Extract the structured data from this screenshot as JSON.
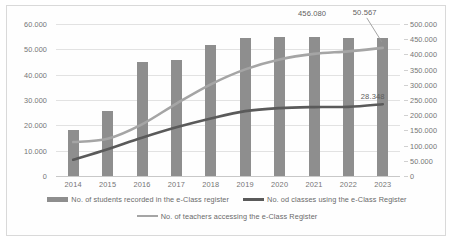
{
  "chart_data": {
    "type": "bar",
    "title": "",
    "subtitle": "",
    "xlabel": "",
    "ylabel": "",
    "grid": true,
    "legend_position": "bottom",
    "categories": [
      "2014",
      "2015",
      "2016",
      "2017",
      "2018",
      "2019",
      "2020",
      "2021",
      "2022",
      "2023"
    ],
    "axes": {
      "left": {
        "ticks": [
          "0",
          "10.000",
          "20.000",
          "30.000",
          "40.000",
          "50.000",
          "60.000"
        ],
        "values": [
          0,
          10000,
          20000,
          30000,
          40000,
          50000,
          60000
        ],
        "min": 0,
        "max": 60000
      },
      "right": {
        "ticks": [
          "0",
          "50.000",
          "100.000",
          "150.000",
          "200.000",
          "250.000",
          "300.000",
          "350.000",
          "400.000",
          "450.000",
          "500.000"
        ],
        "values": [
          0,
          50000,
          100000,
          150000,
          200000,
          250000,
          300000,
          350000,
          400000,
          450000,
          500000
        ],
        "min": 0,
        "max": 500000
      }
    },
    "series": [
      {
        "name": "No. of students recorded in the e-Class register",
        "type": "bar",
        "axis": "right",
        "color": "#8e8e8e",
        "values": [
          150000,
          213000,
          375000,
          383000,
          430000,
          455000,
          456000,
          456080,
          454000,
          455500
        ]
      },
      {
        "name": "No. od classes using the e-Class Register",
        "type": "line",
        "axis": "left",
        "color": "#5a5a5a",
        "values": [
          6400,
          10600,
          15100,
          19200,
          22700,
          25600,
          26800,
          27200,
          27300,
          28348
        ]
      },
      {
        "name": "No. of teachers accessing the e-Class Register",
        "type": "line",
        "axis": "left",
        "color": "#a5a5a5",
        "values": [
          13400,
          14700,
          20400,
          28600,
          36200,
          42100,
          46000,
          48200,
          49200,
          50567
        ]
      }
    ],
    "annotations": [
      {
        "text": "456.080",
        "series": "No. of students recorded in the e-Class register",
        "category": "2021"
      },
      {
        "text": "50.567",
        "series": "No. of teachers accessing the e-Class Register",
        "category": "2023"
      },
      {
        "text": "28.348",
        "series": "No. od classes using the e-Class Register",
        "category": "2023"
      }
    ]
  },
  "legend": {
    "row1": [
      "No. of students recorded in the e-Class register",
      "No. od classes using the e-Class Register"
    ],
    "row2": [
      "No. of teachers accessing the e-Class Register"
    ]
  }
}
